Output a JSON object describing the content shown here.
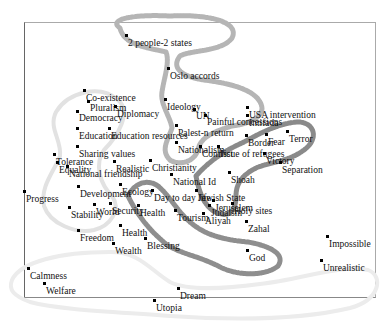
{
  "diagram": {
    "type": "concept-map",
    "ring_color": "#a8a8a8",
    "ring_dark_color": "#7a7a7a",
    "points": [
      {
        "label": "2 people-2 states",
        "x": 126,
        "y": 35,
        "lx": 128,
        "ly": 38
      },
      {
        "label": "Oslo accords",
        "x": 168,
        "y": 68,
        "lx": 170,
        "ly": 71
      },
      {
        "label": "Co-existence",
        "x": 84,
        "y": 90,
        "lx": 86,
        "ly": 93
      },
      {
        "label": "Pluralism",
        "x": 88,
        "y": 101,
        "lx": 90,
        "ly": 103
      },
      {
        "label": "Democracy",
        "x": 77,
        "y": 111,
        "lx": 79,
        "ly": 113
      },
      {
        "label": "Diplomacy",
        "x": 115,
        "y": 106,
        "lx": 117,
        "ly": 109
      },
      {
        "label": "Ideology",
        "x": 165,
        "y": 99,
        "lx": 167,
        "ly": 102
      },
      {
        "label": "UN",
        "x": 194,
        "y": 109,
        "lx": 196,
        "ly": 111
      },
      {
        "label": "Painful concessions",
        "x": 205,
        "y": 115,
        "lx": 207,
        "ly": 117
      },
      {
        "label": "USA intervention",
        "x": 247,
        "y": 107,
        "lx": 249,
        "ly": 110
      },
      {
        "label": "Intifada",
        "x": 247,
        "y": 115,
        "lx": 249,
        "ly": 118
      },
      {
        "label": "Education",
        "x": 77,
        "y": 128,
        "lx": 79,
        "ly": 131
      },
      {
        "label": "Education resources",
        "x": 109,
        "y": 128,
        "lx": 111,
        "ly": 131
      },
      {
        "label": "Palest-n return",
        "x": 176,
        "y": 125,
        "lx": 178,
        "ly": 128
      },
      {
        "label": "Nationalism",
        "x": 176,
        "y": 142,
        "lx": 178,
        "ly": 145
      },
      {
        "label": "Conflict",
        "x": 200,
        "y": 146,
        "lx": 202,
        "ly": 149
      },
      {
        "label": "Issue of refugees",
        "x": 218,
        "y": 146,
        "lx": 220,
        "ly": 149
      },
      {
        "label": "Border",
        "x": 246,
        "y": 135,
        "lx": 248,
        "ly": 138
      },
      {
        "label": "Fear",
        "x": 266,
        "y": 134,
        "lx": 268,
        "ly": 137
      },
      {
        "label": "Terror",
        "x": 287,
        "y": 131,
        "lx": 289,
        "ly": 134
      },
      {
        "label": "Sharing values",
        "x": 77,
        "y": 146,
        "lx": 79,
        "ly": 149
      },
      {
        "label": "Tolerance",
        "x": 54,
        "y": 154,
        "lx": 56,
        "ly": 157
      },
      {
        "label": "Equality",
        "x": 57,
        "y": 162,
        "lx": 59,
        "ly": 165
      },
      {
        "label": "National friendship",
        "x": 67,
        "y": 166,
        "lx": 69,
        "ly": 169
      },
      {
        "label": "Realistic",
        "x": 114,
        "y": 161,
        "lx": 116,
        "ly": 164
      },
      {
        "label": "Christianity",
        "x": 150,
        "y": 160,
        "lx": 152,
        "ly": 163
      },
      {
        "label": "Victory",
        "x": 264,
        "y": 153,
        "lx": 266,
        "ly": 156
      },
      {
        "label": "Separation",
        "x": 280,
        "y": 162,
        "lx": 282,
        "ly": 165
      },
      {
        "label": "National Id",
        "x": 171,
        "y": 174,
        "lx": 173,
        "ly": 177
      },
      {
        "label": "Shoah",
        "x": 229,
        "y": 172,
        "lx": 231,
        "ly": 175
      },
      {
        "label": "Progress",
        "x": 24,
        "y": 191,
        "lx": 26,
        "ly": 194
      },
      {
        "label": "Development",
        "x": 78,
        "y": 186,
        "lx": 80,
        "ly": 189
      },
      {
        "label": "Ecology",
        "x": 120,
        "y": 184,
        "lx": 122,
        "ly": 187
      },
      {
        "label": "Day to day life",
        "x": 152,
        "y": 190,
        "lx": 154,
        "ly": 193
      },
      {
        "label": "Jewish State",
        "x": 196,
        "y": 190,
        "lx": 198,
        "ly": 193
      },
      {
        "label": "Stability",
        "x": 69,
        "y": 207,
        "lx": 71,
        "ly": 210
      },
      {
        "label": "World",
        "x": 94,
        "y": 204,
        "lx": 96,
        "ly": 207
      },
      {
        "label": "Security",
        "x": 110,
        "y": 203,
        "lx": 112,
        "ly": 206
      },
      {
        "label": "Health",
        "x": 138,
        "y": 205,
        "lx": 140,
        "ly": 208
      },
      {
        "label": "Jerusalem",
        "x": 213,
        "y": 200,
        "lx": 215,
        "ly": 203
      },
      {
        "label": "Judaism",
        "x": 209,
        "y": 205,
        "lx": 211,
        "ly": 208
      },
      {
        "label": "Holy sites",
        "x": 232,
        "y": 203,
        "lx": 234,
        "ly": 206
      },
      {
        "label": "Tourism",
        "x": 175,
        "y": 210,
        "lx": 177,
        "ly": 213
      },
      {
        "label": "Aliyah",
        "x": 203,
        "y": 213,
        "lx": 205,
        "ly": 216
      },
      {
        "label": "Zahal",
        "x": 246,
        "y": 221,
        "lx": 248,
        "ly": 224
      },
      {
        "label": "Freedom",
        "x": 78,
        "y": 230,
        "lx": 80,
        "ly": 233
      },
      {
        "label": "Health",
        "x": 120,
        "y": 225,
        "lx": 122,
        "ly": 228
      },
      {
        "label": "Blessing",
        "x": 145,
        "y": 238,
        "lx": 147,
        "ly": 241
      },
      {
        "label": "Wealth",
        "x": 113,
        "y": 243,
        "lx": 115,
        "ly": 246
      },
      {
        "label": "God",
        "x": 247,
        "y": 250,
        "lx": 249,
        "ly": 253
      },
      {
        "label": "Impossible",
        "x": 327,
        "y": 236,
        "lx": 329,
        "ly": 239
      },
      {
        "label": "Unrealistic",
        "x": 321,
        "y": 260,
        "lx": 323,
        "ly": 263
      },
      {
        "label": "Calmness",
        "x": 28,
        "y": 268,
        "lx": 30,
        "ly": 271
      },
      {
        "label": "Welfare",
        "x": 44,
        "y": 283,
        "lx": 46,
        "ly": 286
      },
      {
        "label": "Dream",
        "x": 178,
        "y": 288,
        "lx": 180,
        "ly": 291
      },
      {
        "label": "Utopia",
        "x": 154,
        "y": 300,
        "lx": 156,
        "ly": 303
      }
    ]
  }
}
